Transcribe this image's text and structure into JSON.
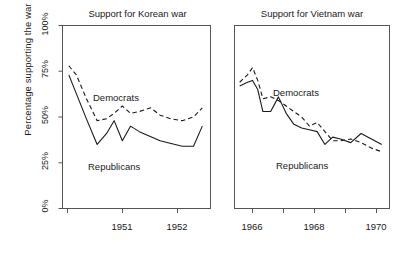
{
  "figure": {
    "ylabel": "Percentage supporting the war",
    "y_ticks": [
      "0%",
      "25%",
      "50%",
      "75%",
      "100%"
    ],
    "line_color": "#1a1a1a",
    "frame_color": "#555555",
    "background": "#ffffff"
  },
  "panels": [
    {
      "title": "Support for Korean war",
      "x_ticks": [
        "1951",
        "1952"
      ],
      "labels": {
        "democrats": "Democrats",
        "republicans": "Republicans"
      }
    },
    {
      "title": "Support for Vietnam war",
      "x_ticks": [
        "1966",
        "1968",
        "1970"
      ],
      "labels": {
        "democrats": "Democrats",
        "republicans": "Republicans"
      }
    }
  ],
  "chart_data": {
    "type": "line",
    "ylabel": "Percentage supporting the war",
    "xlabel": "",
    "ylim": [
      0,
      100
    ],
    "yticks": [
      0,
      25,
      50,
      75,
      100
    ],
    "grid": false,
    "legend": "inline-annotations",
    "panels": [
      {
        "title": "Support for Korean war",
        "xlim": [
          1950.4,
          1952.75
        ],
        "xticks": [
          1951,
          1952
        ],
        "series": [
          {
            "name": "Democrats",
            "style": "dashed",
            "x": [
              1950.5,
              1950.62,
              1950.78,
              1950.95,
              1951.1,
              1951.22,
              1951.35,
              1951.48,
              1951.62,
              1951.8,
              1951.95,
              1952.12,
              1952.3,
              1952.48,
              1952.62
            ],
            "y": [
              78,
              73,
              60,
              48,
              49,
              52,
              56,
              52,
              53,
              55,
              51,
              49,
              48,
              50,
              55,
              61
            ]
          },
          {
            "name": "Republicans",
            "style": "solid",
            "x": [
              1950.5,
              1950.78,
              1950.95,
              1951.1,
              1951.22,
              1951.35,
              1951.48,
              1951.62,
              1951.95,
              1952.3,
              1952.48,
              1952.62
            ],
            "y": [
              73,
              49,
              35,
              41,
              48,
              37,
              45,
              42,
              37,
              34,
              34,
              45
            ]
          }
        ]
      },
      {
        "title": "Support for Vietnam war",
        "xlim": [
          1965.2,
          1971.2
        ],
        "xticks": [
          1966,
          1967,
          1968,
          1969,
          1970,
          1971
        ],
        "series": [
          {
            "name": "Democrats",
            "style": "dashed",
            "x": [
              1965.4,
              1965.7,
              1965.9,
              1966.1,
              1966.3,
              1966.6,
              1966.9,
              1967.2,
              1967.5,
              1967.8,
              1968.1,
              1968.4,
              1968.7,
              1969.0,
              1969.3,
              1969.7,
              1970.1,
              1970.5,
              1970.9
            ],
            "y": [
              69,
              73,
              77,
              70,
              60,
              61,
              59,
              56,
              53,
              50,
              45,
              47,
              42,
              37,
              37,
              38,
              36,
              33,
              31
            ]
          },
          {
            "name": "Republicans",
            "style": "solid",
            "x": [
              1965.4,
              1965.7,
              1965.9,
              1966.1,
              1966.3,
              1966.6,
              1966.9,
              1967.2,
              1967.5,
              1967.8,
              1968.1,
              1968.4,
              1968.7,
              1969.0,
              1969.3,
              1969.7,
              1970.1,
              1970.5,
              1970.9
            ],
            "y": [
              67,
              69,
              70,
              65,
              53,
              53,
              61,
              52,
              46,
              44,
              43,
              42,
              35,
              39,
              38,
              36,
              41,
              38,
              35
            ]
          }
        ]
      }
    ]
  }
}
